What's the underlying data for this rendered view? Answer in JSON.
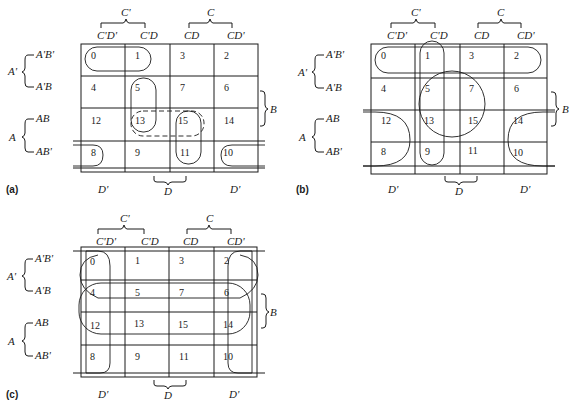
{
  "figure": {
    "col_headers": [
      "C'D'",
      "C'D",
      "CD",
      "CD'"
    ],
    "col_groups": {
      "c_prime": "C'",
      "c": "C"
    },
    "row_headers": [
      "A'B'",
      "A'B",
      "AB",
      "AB'"
    ],
    "row_groups": {
      "a_prime": "A'",
      "a": "A"
    },
    "right_group": "B",
    "bottom_labels": {
      "left": "D'",
      "middle": "D",
      "right": "D'"
    },
    "cells": [
      [
        "0",
        "1",
        "3",
        "2"
      ],
      [
        "4",
        "5",
        "7",
        "6"
      ],
      [
        "12",
        "13",
        "15",
        "14"
      ],
      [
        "8",
        "9",
        "11",
        "10"
      ]
    ],
    "panels": [
      {
        "id": "a",
        "label": "(a)",
        "groupings": [
          "0-1",
          "5-13",
          "13-15 (dashed)",
          "15-11",
          "8-10 wrap"
        ]
      },
      {
        "id": "b",
        "label": "(b)",
        "groupings": [
          "0-1-3-2 row",
          "1-5-13-9 column",
          "5-7-13-15 circle",
          "12-8-14-10 wrap"
        ]
      },
      {
        "id": "c",
        "label": "(c)",
        "groupings": [
          "0-4-12-8 column",
          "2-6-14-10 column",
          "4-5-7-6-12-13-15-14 rows",
          "0-2 / 4-6 wrap"
        ]
      }
    ]
  }
}
